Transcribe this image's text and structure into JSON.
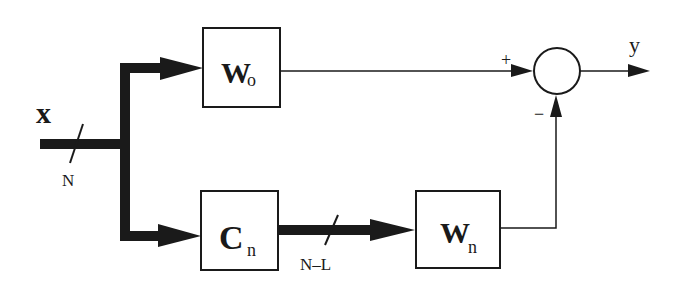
{
  "diagram": {
    "type": "block-diagram",
    "input": {
      "label": "x",
      "bus_width": "N"
    },
    "blocks": [
      {
        "id": "w0",
        "main": "W",
        "sub": "o"
      },
      {
        "id": "cn",
        "main": "C",
        "sub": "n"
      },
      {
        "id": "wn",
        "main": "W",
        "sub": "n"
      }
    ],
    "bus_cn_to_wn": {
      "width_label": "N–L"
    },
    "summing_junction": {
      "plus_sign": "+",
      "minus_sign": "−"
    },
    "output": {
      "label": "y"
    },
    "colors": {
      "line": "#1a1a1a",
      "background": "#ffffff"
    }
  }
}
